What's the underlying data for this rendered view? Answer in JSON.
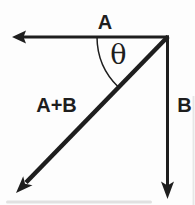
{
  "figure": {
    "ink_color": "#1e1e1e",
    "background_color": "#fdfdfd",
    "artifact_color": "#bfbfbf",
    "labels": {
      "vector_a": "A",
      "vector_b": "B",
      "resultant": "A+B",
      "angle": "θ"
    }
  }
}
